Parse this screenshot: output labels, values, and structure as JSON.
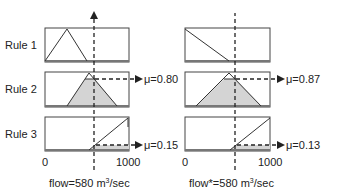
{
  "rules": [
    {
      "label": "Rule 1"
    },
    {
      "label": "Rule 2"
    },
    {
      "label": "Rule 3"
    }
  ],
  "left_panel": {
    "axis_min": "0",
    "axis_max": "1000",
    "caption_prefix": "flow=580 m",
    "caption_sup": "3",
    "caption_suffix": "/sec",
    "mu": [
      "μ=0.80",
      "μ=0.15"
    ]
  },
  "right_panel": {
    "axis_min": "0",
    "axis_max": "1000",
    "caption_prefix": "flow*=580 m",
    "caption_sup": "3",
    "caption_suffix": "/sec",
    "mu": [
      "μ=0.87",
      "μ=0.13"
    ]
  },
  "colors": {
    "shade": "#d4d4d4",
    "line": "#333333"
  }
}
